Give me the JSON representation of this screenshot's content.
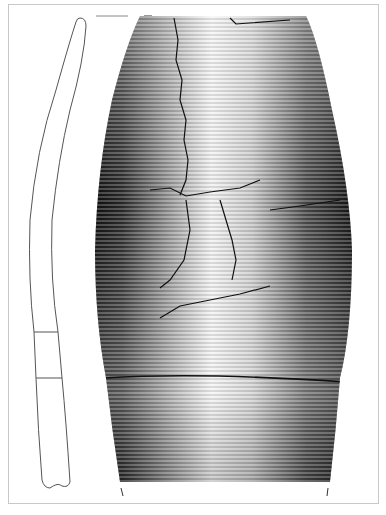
{
  "figure": {
    "type": "archaeological-vessel-drawing",
    "colors": {
      "frame": "#c8c8c8",
      "ink": "#111111",
      "profile_line": "#555555",
      "background": "#ffffff"
    },
    "profile": {
      "segments": 3,
      "breaks_y": [
        332,
        378
      ]
    },
    "surface": {
      "top_y": 16,
      "bottom_y": 482,
      "widest_y": 240,
      "horizontal_break_y": 378
    }
  }
}
